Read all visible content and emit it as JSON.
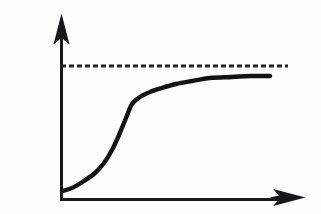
{
  "figure": {
    "title": "Sigmoid growth curve approaching an asymptote",
    "background_color": "#fdfdfd",
    "ink_color": "#131313",
    "width": 321,
    "height": 214
  },
  "axes": {
    "y_axis": {
      "name": "vertical-axis",
      "label": "",
      "origin_x": 61,
      "top_y": 14,
      "bottom_y": 200,
      "has_arrowhead": true,
      "arrow_direction": "up",
      "tick_labels": []
    },
    "x_axis": {
      "name": "horizontal-axis",
      "label": "",
      "origin_y": 200,
      "left_x": 61,
      "right_x": 305,
      "has_arrowhead": true,
      "arrow_direction": "right",
      "tick_labels": []
    }
  },
  "asymptote": {
    "name": "asymptote-dashed-line",
    "label": "",
    "style": "dashed",
    "y": 66,
    "start_x": 61,
    "end_x": 288,
    "dash_length": 5,
    "gap_length": 3,
    "color": "#232321"
  },
  "chart_data": {
    "type": "line",
    "title": "Sigmoid growth curve approaching an asymptote",
    "subtitle": "",
    "xlabel": "",
    "ylabel": "",
    "grid": false,
    "legend": "none",
    "legend_entries": [],
    "annotations": [
      {
        "name": "asymptote",
        "text": "",
        "type": "horizontal-dashed-line",
        "y_value": 1.0
      }
    ],
    "xlim": [
      0,
      1
    ],
    "ylim": [
      0,
      1.12
    ],
    "axis_tick_labels": {
      "x": [],
      "y": []
    },
    "series": [
      {
        "name": "sigmoid",
        "color": "#131313",
        "x": [
          0.0,
          0.04,
          0.09,
          0.13,
          0.18,
          0.22,
          0.26,
          0.3,
          0.34,
          0.38,
          0.42,
          0.46,
          0.5,
          0.55,
          0.6,
          0.66,
          0.72,
          0.78,
          0.85,
          0.92,
          1.0
        ],
        "y": [
          0.045,
          0.062,
          0.09,
          0.124,
          0.168,
          0.225,
          0.3,
          0.4,
          0.505,
          0.58,
          0.63,
          0.672,
          0.71,
          0.752,
          0.788,
          0.82,
          0.845,
          0.862,
          0.875,
          0.882,
          0.888
        ]
      }
    ],
    "curve_path_points": [
      {
        "x": 62,
        "y": 191
      },
      {
        "x": 72,
        "y": 188
      },
      {
        "x": 84,
        "y": 181
      },
      {
        "x": 95,
        "y": 173
      },
      {
        "x": 104,
        "y": 163
      },
      {
        "x": 112,
        "y": 150
      },
      {
        "x": 119,
        "y": 135
      },
      {
        "x": 126,
        "y": 118
      },
      {
        "x": 132,
        "y": 104
      },
      {
        "x": 140,
        "y": 97
      },
      {
        "x": 150,
        "y": 92
      },
      {
        "x": 162,
        "y": 88
      },
      {
        "x": 176,
        "y": 84
      },
      {
        "x": 192,
        "y": 81
      },
      {
        "x": 210,
        "y": 78
      },
      {
        "x": 232,
        "y": 77
      },
      {
        "x": 250,
        "y": 76
      },
      {
        "x": 270,
        "y": 76
      }
    ]
  }
}
